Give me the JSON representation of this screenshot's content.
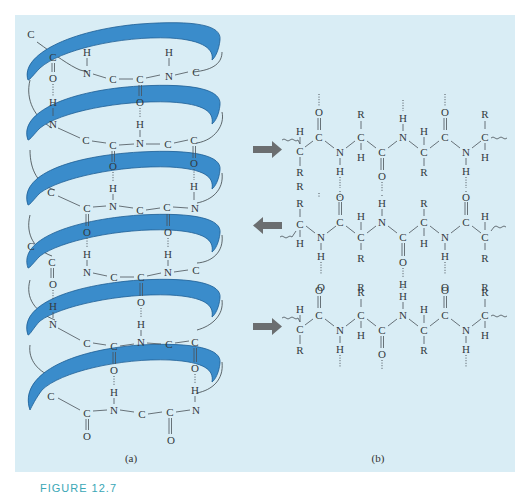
{
  "figure": {
    "background_color": "#ffffff",
    "panel_color": "#d9edf5",
    "ribbon_color": "#3a8ccb",
    "ribbon_edge_color": "#1e5e94",
    "arrow_color": "#6b6e70",
    "caption_color": "#3aa7b6",
    "caption_text": "FIGURE 12.7"
  },
  "panel_a": {
    "label": "(a)",
    "title": "alpha-helix",
    "turns": [
      {
        "top_chain": [
          "C",
          "N",
          "C",
          "C",
          "N",
          "C"
        ],
        "h_over": [
          "H",
          "H"
        ],
        "o_under": [
          "O"
        ]
      },
      {
        "chain": [
          "N",
          "C",
          "C",
          "N",
          "C",
          "C"
        ],
        "h_bonds": [
          "O···H",
          "O···H"
        ]
      },
      {
        "chain": [
          "C",
          "C",
          "N",
          "C",
          "C",
          "N"
        ],
        "h_bonds": [
          "O···H",
          "O···H"
        ]
      },
      {
        "chain": [
          "N",
          "C",
          "C",
          "N",
          "C"
        ],
        "h_bonds": [
          "O···H",
          "O···H"
        ]
      },
      {
        "chain": [
          "N",
          "C",
          "C",
          "N",
          "C",
          "C"
        ],
        "h_bonds": [
          "O···H",
          "O···H"
        ]
      },
      {
        "chain": [
          "C",
          "C",
          "N",
          "C",
          "C",
          "N"
        ],
        "terminal_O": [
          "O",
          "O"
        ]
      }
    ],
    "start_atom": "C"
  },
  "panel_b": {
    "label": "(b)",
    "title": "beta-pleated sheet",
    "strands": [
      {
        "direction": "right",
        "arrow": "right-arrow"
      },
      {
        "direction": "left",
        "arrow": "left-arrow"
      },
      {
        "direction": "right",
        "arrow": "right-arrow"
      }
    ],
    "atoms": {
      "carbon": "C",
      "nitrogen": "N",
      "oxygen": "O",
      "hydrogen": "H",
      "side_chain": "R"
    }
  }
}
